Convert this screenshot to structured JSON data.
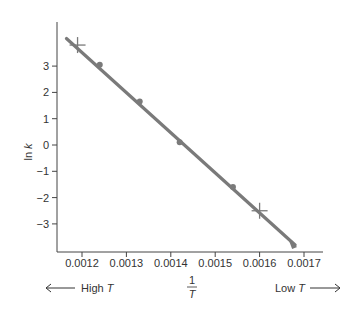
{
  "chart_data": {
    "type": "line",
    "title": "",
    "xlabel": "1/T",
    "ylabel": "ln k",
    "xlim": [
      0.00115,
      0.00176
    ],
    "ylim": [
      -3.9,
      4.3
    ],
    "grid": false,
    "legend": null,
    "x_ticks": [
      "0.0012",
      "0.0013",
      "0.0014",
      "0.0015",
      "0.0016",
      "0.0017"
    ],
    "y_ticks": [
      "3",
      "2",
      "1",
      "0",
      "-1",
      "-2",
      "-3"
    ],
    "series": [
      {
        "name": "Arrhenius plot",
        "color": "#7a7a7a",
        "line_points": [
          {
            "x": 0.001165,
            "y": 4.05
          },
          {
            "x": 0.00168,
            "y": -3.8
          }
        ],
        "markers": [
          {
            "x": 0.00119,
            "y": 3.8,
            "marker": "cross"
          },
          {
            "x": 0.00124,
            "y": 3.05,
            "marker": "dot"
          },
          {
            "x": 0.00133,
            "y": 1.65,
            "marker": "dot"
          },
          {
            "x": 0.00142,
            "y": 0.1,
            "marker": "dot"
          },
          {
            "x": 0.00154,
            "y": -1.6,
            "marker": "dot"
          },
          {
            "x": 0.0016,
            "y": -2.5,
            "marker": "cross"
          },
          {
            "x": 0.00168,
            "y": -3.8,
            "marker": "arrow-end"
          }
        ]
      }
    ],
    "annotations": [
      {
        "text": "High T",
        "direction": "left"
      },
      {
        "text": "Low T",
        "direction": "right"
      }
    ]
  },
  "labels": {
    "ylabel_main": "ln ",
    "ylabel_var": "k",
    "xlabel_num": "1",
    "xlabel_den": "T",
    "high_text": "High ",
    "high_var": "T",
    "low_text": "Low ",
    "low_var": "T"
  }
}
